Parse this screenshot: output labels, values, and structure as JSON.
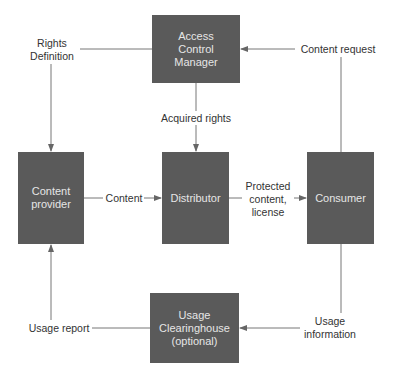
{
  "nodes": {
    "acm": {
      "label": "Access\nControl\nManager"
    },
    "provider": {
      "label": "Content\nprovider"
    },
    "distributor": {
      "label": "Distributor"
    },
    "consumer": {
      "label": "Consumer"
    },
    "clearinghouse": {
      "label": "Usage\nClearinghouse\n(optional)"
    }
  },
  "edges": {
    "rights_definition": "Rights\nDefinition",
    "acquired_rights": "Acquired rights",
    "content_request": "Content request",
    "content": "Content",
    "protected_content": "Protected\ncontent,\nlicense",
    "usage_information": "Usage\ninformation",
    "usage_report": "Usage report"
  },
  "colors": {
    "box": "#5a5a5a",
    "box_text": "#e6e6e6",
    "line": "#666666"
  }
}
